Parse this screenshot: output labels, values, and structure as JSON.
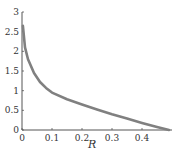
{
  "chart_data": {
    "type": "line",
    "title": "",
    "xlabel": "R",
    "ylabel": "",
    "xlim": [
      0,
      0.5
    ],
    "ylim": [
      0,
      3
    ],
    "grid": false,
    "legend": null,
    "xticks": [
      "0",
      "0.1",
      "0.2",
      "0.3",
      "0.4"
    ],
    "yticks": [
      "0",
      "0.5",
      "1",
      "1.5",
      "2",
      "2.5",
      "3"
    ],
    "series": [
      {
        "name": "curve",
        "color": "#808080",
        "x": [
          0.003,
          0.01,
          0.02,
          0.04,
          0.06,
          0.08,
          0.1,
          0.15,
          0.2,
          0.25,
          0.3,
          0.35,
          0.4,
          0.45,
          0.49
        ],
        "y": [
          2.65,
          2.1,
          1.8,
          1.45,
          1.22,
          1.07,
          0.95,
          0.78,
          0.65,
          0.52,
          0.4,
          0.29,
          0.18,
          0.08,
          0.0
        ]
      }
    ]
  }
}
